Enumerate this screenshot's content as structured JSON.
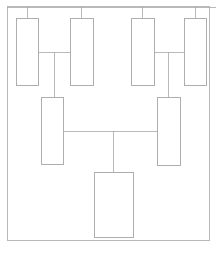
{
  "diagram": {
    "type": "family-tree",
    "canvas": {
      "width": 216,
      "height": 253
    },
    "style": {
      "background_color": "#ffffff",
      "box_fill": "#ffffff",
      "box_stroke": "#9a9a9a",
      "box_stroke_width": 0.8,
      "connector_stroke": "#a8a8a8",
      "connector_stroke_width": 0.8,
      "frame_stroke": "#b0b0b0",
      "frame_stroke_width": 0.9
    },
    "frame": {
      "x": 7,
      "y": 6,
      "width": 202,
      "height": 234
    },
    "top_bus": {
      "y": 7,
      "x1": 7,
      "x2": 216
    },
    "generations": [
      {
        "name": "generation-1",
        "label": "Great-grandparents",
        "boxes": [
          {
            "id": "g1-box-1",
            "label": "",
            "x": 16,
            "y": 18,
            "width": 22,
            "height": 67
          },
          {
            "id": "g1-box-2",
            "label": "",
            "x": 70,
            "y": 18,
            "width": 23,
            "height": 67
          },
          {
            "id": "g1-box-3",
            "label": "",
            "x": 131,
            "y": 18,
            "width": 23,
            "height": 67
          },
          {
            "id": "g1-box-4",
            "label": "",
            "x": 184,
            "y": 18,
            "width": 22,
            "height": 67
          }
        ]
      },
      {
        "name": "generation-2",
        "label": "Grandparents",
        "boxes": [
          {
            "id": "g2-box-1",
            "label": "",
            "x": 41,
            "y": 97,
            "width": 22,
            "height": 67
          },
          {
            "id": "g2-box-2",
            "label": "",
            "x": 157,
            "y": 97,
            "width": 23,
            "height": 68
          }
        ]
      },
      {
        "name": "generation-3",
        "label": "Descendant",
        "boxes": [
          {
            "id": "g3-box-1",
            "label": "",
            "x": 94,
            "y": 172,
            "width": 39,
            "height": 65
          }
        ]
      }
    ],
    "drop_lines": [
      {
        "id": "drop-to-g1-box-1",
        "x": 27,
        "y1": 7,
        "y2": 18
      },
      {
        "id": "drop-to-g1-box-2",
        "x": 81,
        "y1": 7,
        "y2": 18
      },
      {
        "id": "drop-to-g1-box-3",
        "x": 142,
        "y1": 7,
        "y2": 18
      },
      {
        "id": "drop-to-g1-box-4",
        "x": 195,
        "y1": 7,
        "y2": 18
      }
    ],
    "union_connectors": [
      {
        "id": "union-left",
        "label": "",
        "horizontal": {
          "y": 52,
          "x1": 38,
          "x2": 70
        },
        "descent": {
          "x": 54,
          "y1": 52,
          "y2": 97
        }
      },
      {
        "id": "union-right",
        "label": "",
        "horizontal": {
          "y": 52,
          "x1": 154,
          "x2": 184
        },
        "descent": {
          "x": 168,
          "y1": 52,
          "y2": 97
        }
      },
      {
        "id": "union-center",
        "label": "",
        "horizontal": {
          "y": 131,
          "x1": 63,
          "x2": 157
        },
        "descent": {
          "x": 113,
          "y1": 131,
          "y2": 172
        }
      }
    ]
  }
}
